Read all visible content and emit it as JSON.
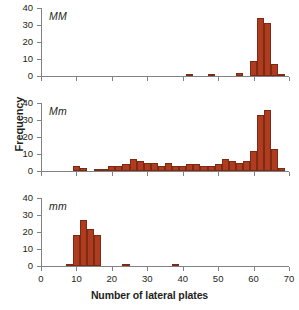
{
  "figure": {
    "ylabel": "Frequency",
    "xlabel": "Number of lateral plates",
    "bar_color": "#b03c20",
    "bar_border_color": "#7d2a14",
    "axis_color": "#808285"
  },
  "axes": {
    "x_ticks": [
      0,
      10,
      20,
      30,
      40,
      50,
      60,
      70
    ],
    "y_ticks": [
      0,
      10,
      20,
      30,
      40
    ],
    "xlim": [
      0,
      70
    ],
    "ylim": [
      0,
      40
    ]
  },
  "panels": [
    {
      "label": "MM"
    },
    {
      "label": "Mm"
    },
    {
      "label": "mm"
    }
  ],
  "chart_data": [
    {
      "type": "bar",
      "title": "MM",
      "xlabel": "Number of lateral plates",
      "ylabel": "Frequency",
      "xlim": [
        0,
        70
      ],
      "ylim": [
        0,
        40
      ],
      "bin_width": 2,
      "bins": [
        41,
        43,
        47,
        49,
        53,
        55,
        57,
        59,
        61,
        63,
        65
      ],
      "values": [
        1,
        0,
        1,
        0,
        0,
        2,
        0,
        9,
        34,
        31,
        7
      ],
      "tail_bin": 67,
      "tail_value": 1
    },
    {
      "type": "bar",
      "title": "Mm",
      "xlabel": "Number of lateral plates",
      "ylabel": "Frequency",
      "xlim": [
        0,
        70
      ],
      "ylim": [
        0,
        40
      ],
      "bin_width": 2,
      "bins": [
        9,
        11,
        13,
        15,
        17,
        19,
        21,
        23,
        25,
        27,
        29,
        31,
        33,
        35,
        37,
        39,
        41,
        43,
        45,
        47,
        49,
        51,
        53,
        55,
        57,
        59,
        61,
        63,
        65,
        67
      ],
      "values": [
        3,
        2,
        0,
        1,
        1,
        3,
        3,
        4,
        7,
        6,
        5,
        5,
        3,
        5,
        3,
        3,
        4,
        4,
        3,
        3,
        4,
        7,
        6,
        5,
        6,
        12,
        33,
        36,
        13,
        2
      ]
    },
    {
      "type": "bar",
      "title": "mm",
      "xlabel": "Number of lateral plates",
      "ylabel": "Frequency",
      "xlim": [
        0,
        70
      ],
      "ylim": [
        0,
        40
      ],
      "bin_width": 2,
      "bins": [
        7,
        9,
        11,
        13,
        15,
        23,
        37
      ],
      "values": [
        1,
        18,
        27,
        22,
        18,
        1,
        1
      ]
    }
  ]
}
